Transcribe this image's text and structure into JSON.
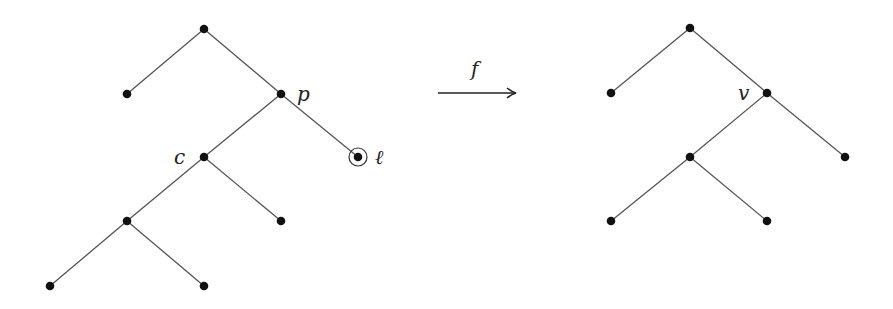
{
  "diagram": {
    "left_tree": {
      "nodes": [
        {
          "id": "root",
          "x": 204,
          "y": 29,
          "label": ""
        },
        {
          "id": "a",
          "x": 127,
          "y": 94,
          "label": ""
        },
        {
          "id": "p",
          "x": 281,
          "y": 94,
          "label": "p",
          "lx": 297,
          "ly": 101
        },
        {
          "id": "c",
          "x": 204,
          "y": 157,
          "label": "c",
          "lx": 174,
          "ly": 164
        },
        {
          "id": "l",
          "x": 358,
          "y": 157,
          "label": "ℓ",
          "lx": 375,
          "ly": 164,
          "circled": true
        },
        {
          "id": "d",
          "x": 127,
          "y": 221,
          "label": ""
        },
        {
          "id": "e",
          "x": 281,
          "y": 221,
          "label": ""
        },
        {
          "id": "g",
          "x": 50,
          "y": 286,
          "label": ""
        },
        {
          "id": "h",
          "x": 204,
          "y": 286,
          "label": ""
        }
      ],
      "edges": [
        [
          "root",
          "a"
        ],
        [
          "root",
          "p"
        ],
        [
          "p",
          "c"
        ],
        [
          "p",
          "l"
        ],
        [
          "c",
          "d"
        ],
        [
          "c",
          "e"
        ],
        [
          "d",
          "g"
        ],
        [
          "d",
          "h"
        ]
      ]
    },
    "arrow": {
      "label": "f",
      "x1": 438,
      "x2": 516,
      "y": 93,
      "label_x": 471,
      "label_y": 76
    },
    "right_tree": {
      "nodes": [
        {
          "id": "root",
          "x": 690,
          "y": 28,
          "label": ""
        },
        {
          "id": "a",
          "x": 611,
          "y": 93,
          "label": ""
        },
        {
          "id": "v",
          "x": 767,
          "y": 93,
          "label": "v",
          "lx": 738,
          "ly": 100
        },
        {
          "id": "c",
          "x": 690,
          "y": 157,
          "label": ""
        },
        {
          "id": "r",
          "x": 845,
          "y": 157,
          "label": ""
        },
        {
          "id": "d",
          "x": 611,
          "y": 221,
          "label": ""
        },
        {
          "id": "e",
          "x": 767,
          "y": 221,
          "label": ""
        }
      ],
      "edges": [
        [
          "root",
          "a"
        ],
        [
          "root",
          "v"
        ],
        [
          "v",
          "c"
        ],
        [
          "v",
          "r"
        ],
        [
          "c",
          "d"
        ],
        [
          "c",
          "e"
        ]
      ]
    }
  }
}
